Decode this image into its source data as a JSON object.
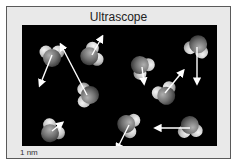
{
  "title": "Ultrascope",
  "scale_label": "1 nm",
  "colors": {
    "panel_bg": "#e9e9e9",
    "panel_border": "#5a5a5a",
    "viewport_bg": "#000000",
    "oxygen": "#7a7a7a",
    "hydrogen": "#d8d8d8",
    "arrow": "#ffffff"
  },
  "molecules": [
    {
      "id": 1,
      "x": 20,
      "y": 20,
      "arrow": {
        "dx": -12,
        "dy": 30
      }
    },
    {
      "id": 2,
      "x": 60,
      "y": 20,
      "arrow": {
        "dx": 10,
        "dy": -18
      }
    },
    {
      "id": 3,
      "x": 110,
      "y": 32,
      "arrow": {
        "dx": 2,
        "dy": 16
      }
    },
    {
      "id": 4,
      "x": 165,
      "y": 12,
      "arrow": {
        "dx": 0,
        "dy": 36
      }
    },
    {
      "id": 5,
      "x": 55,
      "y": 60,
      "arrow": {
        "dx": -26,
        "dy": -50
      }
    },
    {
      "id": 6,
      "x": 133,
      "y": 58,
      "arrow": {
        "dx": 18,
        "dy": -22
      }
    },
    {
      "id": 7,
      "x": 20,
      "y": 96,
      "arrow": {
        "dx": 10,
        "dy": -8
      }
    },
    {
      "id": 8,
      "x": 97,
      "y": 90,
      "arrow": {
        "dx": -12,
        "dy": 24
      }
    },
    {
      "id": 9,
      "x": 158,
      "y": 93,
      "arrow": {
        "dx": -34,
        "dy": 0
      }
    }
  ]
}
